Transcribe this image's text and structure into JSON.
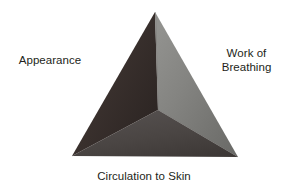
{
  "diagram": {
    "name": "pediatric-assessment-triangle",
    "background_color": "#ffffff",
    "text_color": "#231f20",
    "apex": {
      "x": 155,
      "y": 12
    },
    "bottom_left": {
      "x": 72,
      "y": 156
    },
    "bottom_right": {
      "x": 238,
      "y": 157
    },
    "center": {
      "x": 158,
      "y": 110
    },
    "faces": [
      {
        "id": "left-face",
        "label": "Appearance",
        "fill_start": "#4a403c",
        "fill_end": "#2e2624"
      },
      {
        "id": "right-face",
        "label": "Work of Breathing",
        "fill_start": "#8d8d8a",
        "fill_end": "#6e6e6b"
      },
      {
        "id": "bottom-face",
        "label": "Circulation to Skin",
        "fill_start": "#55504d",
        "fill_end": "#403b39"
      }
    ]
  },
  "labels": {
    "appearance": "Appearance",
    "work_of_breathing_line1": "Work of",
    "work_of_breathing_line2": "Breathing",
    "circulation_to_skin": "Circulation to Skin"
  }
}
